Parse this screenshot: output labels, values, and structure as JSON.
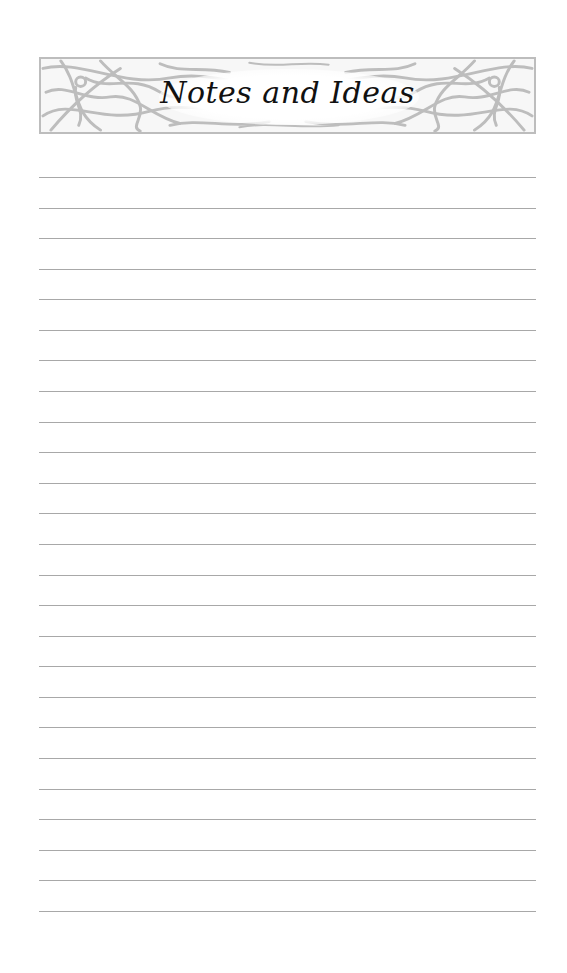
{
  "page": {
    "type": "notes-page",
    "background_color": "#ffffff"
  },
  "header": {
    "title": "Notes and Ideas",
    "ornament": "celtic-knotwork-border-icon",
    "ornament_color": "#bdbdbd"
  },
  "ruled_area": {
    "line_count": 25,
    "line_color": "#a8a8a8",
    "first_line_y": 177,
    "line_spacing": 30.58,
    "lines": [
      {
        "index": 1,
        "text": ""
      },
      {
        "index": 2,
        "text": ""
      },
      {
        "index": 3,
        "text": ""
      },
      {
        "index": 4,
        "text": ""
      },
      {
        "index": 5,
        "text": ""
      },
      {
        "index": 6,
        "text": ""
      },
      {
        "index": 7,
        "text": ""
      },
      {
        "index": 8,
        "text": ""
      },
      {
        "index": 9,
        "text": ""
      },
      {
        "index": 10,
        "text": ""
      },
      {
        "index": 11,
        "text": ""
      },
      {
        "index": 12,
        "text": ""
      },
      {
        "index": 13,
        "text": ""
      },
      {
        "index": 14,
        "text": ""
      },
      {
        "index": 15,
        "text": ""
      },
      {
        "index": 16,
        "text": ""
      },
      {
        "index": 17,
        "text": ""
      },
      {
        "index": 18,
        "text": ""
      },
      {
        "index": 19,
        "text": ""
      },
      {
        "index": 20,
        "text": ""
      },
      {
        "index": 21,
        "text": ""
      },
      {
        "index": 22,
        "text": ""
      },
      {
        "index": 23,
        "text": ""
      },
      {
        "index": 24,
        "text": ""
      },
      {
        "index": 25,
        "text": ""
      }
    ]
  }
}
